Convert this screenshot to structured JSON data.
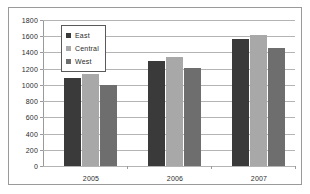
{
  "chart_data": {
    "type": "bar",
    "title": "",
    "xlabel": "",
    "ylabel": "",
    "categories": [
      "2005",
      "2006",
      "2007"
    ],
    "series": [
      {
        "name": "East",
        "color": "#3a3a3a",
        "values": [
          1080,
          1300,
          1570
        ]
      },
      {
        "name": "Central",
        "color": "#a8a8a8",
        "values": [
          1130,
          1350,
          1620
        ]
      },
      {
        "name": "West",
        "color": "#6e6e6e",
        "values": [
          1000,
          1210,
          1450
        ]
      }
    ],
    "ylim": [
      0,
      1800
    ],
    "ytick_step": 200,
    "yticks": [
      0,
      200,
      400,
      600,
      800,
      1000,
      1200,
      1400,
      1600,
      1800
    ],
    "ytick_labels": [
      "0",
      "200",
      "400",
      "600",
      "800",
      "1000",
      "1200",
      "1400",
      "1600",
      "1800"
    ],
    "grid": true,
    "grid_axis": "y",
    "legend_position": "upper-left-inside",
    "legend_entries": [
      "East",
      "Central",
      "West"
    ],
    "frame_border_color": "#9a9a9a",
    "gridline_color": "#b4b4b4",
    "background_color": "#ffffff"
  }
}
